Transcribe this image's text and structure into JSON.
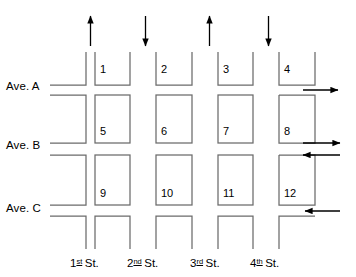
{
  "diagram": {
    "stroke_color": "#555555",
    "arrow_color": "#000000",
    "text_color": "#000000",
    "background": "#ffffff"
  },
  "avenues": [
    {
      "label": "Ave. A",
      "direction": "right",
      "two_way": false,
      "arrows": [
        "right"
      ]
    },
    {
      "label": "Ave. B",
      "direction": "both",
      "two_way": true,
      "arrows": [
        "right",
        "left"
      ]
    },
    {
      "label": "Ave. C",
      "direction": "left",
      "two_way": false,
      "arrows": [
        "left"
      ]
    }
  ],
  "streets": [
    {
      "ordinal": "1",
      "suffix": "st",
      "word": "St.",
      "direction": "up"
    },
    {
      "ordinal": "2",
      "suffix": "nd",
      "word": "St.",
      "direction": "down"
    },
    {
      "ordinal": "3",
      "suffix": "rd",
      "word": "St.",
      "direction": "up"
    },
    {
      "ordinal": "4",
      "suffix": "th",
      "word": "St.",
      "direction": "down"
    }
  ],
  "blocks": [
    {
      "number": "1",
      "row": 1,
      "col": 1
    },
    {
      "number": "2",
      "row": 1,
      "col": 2
    },
    {
      "number": "3",
      "row": 1,
      "col": 3
    },
    {
      "number": "4",
      "row": 1,
      "col": 4
    },
    {
      "number": "5",
      "row": 2,
      "col": 1
    },
    {
      "number": "6",
      "row": 2,
      "col": 2
    },
    {
      "number": "7",
      "row": 2,
      "col": 3
    },
    {
      "number": "8",
      "row": 2,
      "col": 4
    },
    {
      "number": "9",
      "row": 3,
      "col": 1
    },
    {
      "number": "10",
      "row": 3,
      "col": 2
    },
    {
      "number": "11",
      "row": 3,
      "col": 3
    },
    {
      "number": "12",
      "row": 3,
      "col": 4
    }
  ]
}
